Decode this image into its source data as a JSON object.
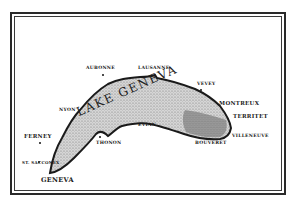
{
  "map": {
    "title": "LAKE GENEVA",
    "colors": {
      "ink": "#1a1a1a",
      "lake_fill": "#bdbdbd",
      "paper": "#ffffff"
    },
    "places": [
      {
        "name": "AUBONNE",
        "x": 87,
        "y": 66,
        "dot": [
          102,
          74
        ]
      },
      {
        "name": "LAUSANNE",
        "x": 138,
        "y": 66,
        "dot": null
      },
      {
        "name": "VEVEY",
        "x": 197,
        "y": 83,
        "dot": [
          200,
          90
        ]
      },
      {
        "name": "MONTREUX",
        "x": 219,
        "y": 101,
        "dot": null
      },
      {
        "name": "TERRITET",
        "x": 233,
        "y": 114,
        "dot": null
      },
      {
        "name": "VILLENEUVE",
        "x": 232,
        "y": 134,
        "dot": null
      },
      {
        "name": "BOUVERET",
        "x": 195,
        "y": 140,
        "dot": null
      },
      {
        "name": "EVIAN",
        "x": 138,
        "y": 123,
        "dot": null
      },
      {
        "name": "THONON",
        "x": 96,
        "y": 140,
        "dot": [
          99,
          136
        ]
      },
      {
        "name": "NYON",
        "x": 60,
        "y": 108,
        "dot": null
      },
      {
        "name": "FERNEY",
        "x": 25,
        "y": 133,
        "dot": [
          39,
          143
        ]
      },
      {
        "name": "ST. SACCONEX",
        "x": 23,
        "y": 161,
        "dot": [
          38,
          162
        ]
      },
      {
        "name": "GENEVA",
        "x": 41,
        "y": 177,
        "dot": null
      }
    ]
  }
}
